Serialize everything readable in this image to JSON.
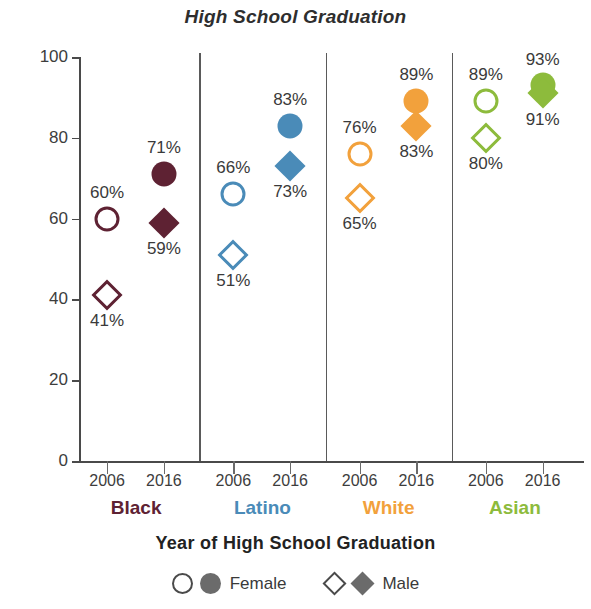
{
  "chart_data": {
    "type": "scatter",
    "title": "High School Graduation",
    "xlabel": "Year of High School Graduation",
    "ylabel": "Percent of First-Time Freshmen",
    "ylim": [
      0,
      100
    ],
    "yticks": [
      0,
      20,
      40,
      60,
      80,
      100
    ],
    "grid": false,
    "legend_position": "bottom",
    "categories": [
      "2006",
      "2016"
    ],
    "groups": [
      {
        "name": "Black",
        "color": "#5E2233",
        "points": [
          {
            "year": "2006",
            "series": "Female",
            "marker": "circle",
            "fill": "open",
            "value": 60,
            "label": "60%",
            "label_pos": "above"
          },
          {
            "year": "2006",
            "series": "Male",
            "marker": "diamond",
            "fill": "open",
            "value": 41,
            "label": "41%",
            "label_pos": "below"
          },
          {
            "year": "2016",
            "series": "Female",
            "marker": "circle",
            "fill": "filled",
            "value": 71,
            "label": "71%",
            "label_pos": "above"
          },
          {
            "year": "2016",
            "series": "Male",
            "marker": "diamond",
            "fill": "filled",
            "value": 59,
            "label": "59%",
            "label_pos": "below"
          }
        ]
      },
      {
        "name": "Latino",
        "color": "#4A8BB8",
        "points": [
          {
            "year": "2006",
            "series": "Female",
            "marker": "circle",
            "fill": "open",
            "value": 66,
            "label": "66%",
            "label_pos": "above"
          },
          {
            "year": "2006",
            "series": "Male",
            "marker": "diamond",
            "fill": "open",
            "value": 51,
            "label": "51%",
            "label_pos": "below"
          },
          {
            "year": "2016",
            "series": "Female",
            "marker": "circle",
            "fill": "filled",
            "value": 83,
            "label": "83%",
            "label_pos": "above"
          },
          {
            "year": "2016",
            "series": "Male",
            "marker": "diamond",
            "fill": "filled",
            "value": 73,
            "label": "73%",
            "label_pos": "below"
          }
        ]
      },
      {
        "name": "White",
        "color": "#F2A13C",
        "points": [
          {
            "year": "2006",
            "series": "Female",
            "marker": "circle",
            "fill": "open",
            "value": 76,
            "label": "76%",
            "label_pos": "above"
          },
          {
            "year": "2006",
            "series": "Male",
            "marker": "diamond",
            "fill": "open",
            "value": 65,
            "label": "65%",
            "label_pos": "below"
          },
          {
            "year": "2016",
            "series": "Female",
            "marker": "circle",
            "fill": "filled",
            "value": 89,
            "label": "89%",
            "label_pos": "above"
          },
          {
            "year": "2016",
            "series": "Male",
            "marker": "diamond",
            "fill": "filled",
            "value": 83,
            "label": "83%",
            "label_pos": "below"
          }
        ]
      },
      {
        "name": "Asian",
        "color": "#8DBB3C",
        "points": [
          {
            "year": "2006",
            "series": "Female",
            "marker": "circle",
            "fill": "open",
            "value": 89,
            "label": "89%",
            "label_pos": "above"
          },
          {
            "year": "2006",
            "series": "Male",
            "marker": "diamond",
            "fill": "open",
            "value": 80,
            "label": "80%",
            "label_pos": "below"
          },
          {
            "year": "2016",
            "series": "Female",
            "marker": "circle",
            "fill": "filled",
            "value": 93,
            "label": "93%",
            "label_pos": "above"
          },
          {
            "year": "2016",
            "series": "Male",
            "marker": "diamond",
            "fill": "filled",
            "value": 91,
            "label": "91%",
            "label_pos": "below"
          }
        ]
      }
    ],
    "legend": [
      {
        "label": "Female",
        "markers": [
          "circle-open",
          "circle-filled"
        ]
      },
      {
        "label": "Male",
        "markers": [
          "diamond-open",
          "diamond-filled"
        ]
      }
    ]
  }
}
